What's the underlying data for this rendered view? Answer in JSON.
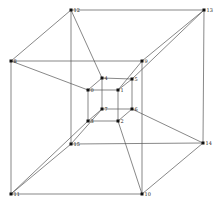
{
  "diagram": {
    "type": "graph",
    "nodes": [
      {
        "id": "0",
        "x": 88,
        "y": 90
      },
      {
        "id": "1",
        "x": 118,
        "y": 90
      },
      {
        "id": "2",
        "x": 118,
        "y": 121
      },
      {
        "id": "3",
        "x": 88,
        "y": 121
      },
      {
        "id": "4",
        "x": 102,
        "y": 78
      },
      {
        "id": "5",
        "x": 132,
        "y": 79
      },
      {
        "id": "6",
        "x": 132,
        "y": 109
      },
      {
        "id": "7",
        "x": 102,
        "y": 109
      },
      {
        "id": "8",
        "x": 11,
        "y": 61
      },
      {
        "id": "9",
        "x": 142,
        "y": 61
      },
      {
        "id": "10",
        "x": 142,
        "y": 194
      },
      {
        "id": "11",
        "x": 11,
        "y": 194
      },
      {
        "id": "12",
        "x": 71,
        "y": 10
      },
      {
        "id": "13",
        "x": 204,
        "y": 10
      },
      {
        "id": "14",
        "x": 203,
        "y": 143
      },
      {
        "id": "15",
        "x": 71,
        "y": 144
      }
    ],
    "edges": [
      [
        "0",
        "1"
      ],
      [
        "1",
        "2"
      ],
      [
        "2",
        "3"
      ],
      [
        "3",
        "0"
      ],
      [
        "4",
        "5"
      ],
      [
        "5",
        "6"
      ],
      [
        "6",
        "7"
      ],
      [
        "7",
        "4"
      ],
      [
        "0",
        "4"
      ],
      [
        "1",
        "5"
      ],
      [
        "2",
        "6"
      ],
      [
        "3",
        "7"
      ],
      [
        "8",
        "9"
      ],
      [
        "9",
        "10"
      ],
      [
        "10",
        "11"
      ],
      [
        "11",
        "8"
      ],
      [
        "12",
        "13"
      ],
      [
        "13",
        "14"
      ],
      [
        "14",
        "15"
      ],
      [
        "15",
        "12"
      ],
      [
        "8",
        "12"
      ],
      [
        "9",
        "13"
      ],
      [
        "10",
        "14"
      ],
      [
        "11",
        "15"
      ],
      [
        "0",
        "8"
      ],
      [
        "1",
        "9"
      ],
      [
        "2",
        "10"
      ],
      [
        "3",
        "11"
      ],
      [
        "4",
        "12"
      ],
      [
        "5",
        "13"
      ],
      [
        "6",
        "14"
      ],
      [
        "7",
        "15"
      ]
    ]
  }
}
